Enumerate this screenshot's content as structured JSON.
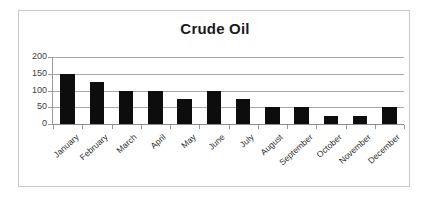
{
  "chart_data": {
    "type": "bar",
    "title": "Crude Oil",
    "xlabel": "",
    "ylabel": "",
    "categories": [
      "January",
      "February",
      "March",
      "April",
      "May",
      "June",
      "July",
      "August",
      "September",
      "October",
      "November",
      "December"
    ],
    "values": [
      150,
      125,
      100,
      100,
      75,
      100,
      75,
      50,
      50,
      25,
      25,
      50
    ],
    "series": [
      {
        "name": "Crude Oil",
        "values": [
          150,
          125,
          100,
          100,
          75,
          100,
          75,
          50,
          50,
          25,
          25,
          50
        ]
      }
    ],
    "ylim": [
      0,
      200
    ],
    "yticks": [
      0,
      50,
      100,
      150,
      200
    ],
    "ytick_labels": [
      "0",
      "50",
      "100",
      "150",
      "200"
    ],
    "grid": true,
    "grid_axis": "y",
    "legend": false,
    "legend_position": "none",
    "bar_color": "#0d0d0d",
    "gridline_color": "#a8a8a8",
    "axis_color": "#9a9a9a",
    "text_color": "#2e2e2e",
    "title_color": "#1a1a1a",
    "plot_background": "#ffffff",
    "frame_border_color": "#c9c9c9",
    "xtick_label_rotation": -42
  }
}
